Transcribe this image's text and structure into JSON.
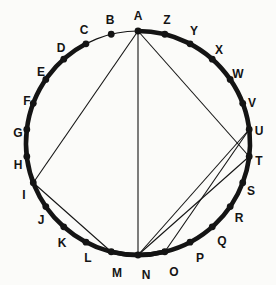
{
  "figure": {
    "type": "geometry-diagram",
    "background_color": "#fbfbf9",
    "stroke_color": "#141414",
    "circle": {
      "cx": 138,
      "cy": 143,
      "r": 112,
      "stroke_width": 1.2
    },
    "point_radius": 3.4,
    "labels": [
      {
        "id": "A",
        "text": "A",
        "angle": 90,
        "lx": 138,
        "ly": 16
      },
      {
        "id": "B",
        "text": "B",
        "angle": 103.846,
        "lx": 110,
        "ly": 20
      },
      {
        "id": "C",
        "text": "C",
        "angle": 117.692,
        "lx": 84,
        "ly": 30
      },
      {
        "id": "D",
        "text": "D",
        "angle": 131.538,
        "lx": 61,
        "ly": 48
      },
      {
        "id": "E",
        "text": "E",
        "angle": 145.385,
        "lx": 41,
        "ly": 72
      },
      {
        "id": "F",
        "text": "F",
        "angle": 159.231,
        "lx": 27,
        "ly": 101
      },
      {
        "id": "G",
        "text": "G",
        "angle": 173.077,
        "lx": 18,
        "ly": 133
      },
      {
        "id": "H",
        "text": "H",
        "angle": 186.923,
        "lx": 18,
        "ly": 165
      },
      {
        "id": "I",
        "text": "I",
        "angle": 200.769,
        "lx": 24,
        "ly": 195
      },
      {
        "id": "J",
        "text": "J",
        "angle": 214.615,
        "lx": 41,
        "ly": 220
      },
      {
        "id": "K",
        "text": "K",
        "angle": 228.462,
        "lx": 62,
        "ly": 243
      },
      {
        "id": "L",
        "text": "L",
        "angle": 242.308,
        "lx": 88,
        "ly": 258
      },
      {
        "id": "M",
        "text": "M",
        "angle": 256.154,
        "lx": 117,
        "ly": 273
      },
      {
        "id": "N",
        "text": "N",
        "angle": 270,
        "lx": 146,
        "ly": 275
      },
      {
        "id": "O",
        "text": "O",
        "angle": 283.846,
        "lx": 174,
        "ly": 272
      },
      {
        "id": "P",
        "text": "P",
        "angle": 297.692,
        "lx": 200,
        "ly": 258
      },
      {
        "id": "Q",
        "text": "Q",
        "angle": 311.538,
        "lx": 222,
        "ly": 241
      },
      {
        "id": "R",
        "text": "R",
        "angle": 325.385,
        "lx": 239,
        "ly": 218
      },
      {
        "id": "S",
        "text": "S",
        "angle": 339.231,
        "lx": 251,
        "ly": 191
      },
      {
        "id": "T",
        "text": "T",
        "angle": 353.077,
        "lx": 259,
        "ly": 161
      },
      {
        "id": "U",
        "text": "U",
        "angle": 6.923,
        "lx": 259,
        "ly": 131
      },
      {
        "id": "V",
        "text": "V",
        "angle": 20.769,
        "lx": 252,
        "ly": 103
      },
      {
        "id": "W",
        "text": "W",
        "angle": 34.615,
        "lx": 238,
        "ly": 74
      },
      {
        "id": "X",
        "text": "X",
        "angle": 48.462,
        "lx": 219,
        "ly": 50
      },
      {
        "id": "Y",
        "text": "Y",
        "angle": 62.308,
        "lx": 194,
        "ly": 31
      },
      {
        "id": "Z",
        "text": "Z",
        "angle": 76.154,
        "lx": 167,
        "ly": 20
      }
    ],
    "chords": [
      {
        "from": "A",
        "to": "I"
      },
      {
        "from": "A",
        "to": "N"
      },
      {
        "from": "A",
        "to": "T"
      },
      {
        "from": "I",
        "to": "M"
      },
      {
        "from": "N",
        "to": "U"
      },
      {
        "from": "N",
        "to": "T"
      },
      {
        "from": "O",
        "to": "U"
      },
      {
        "from": "U",
        "to": "T"
      }
    ],
    "highlighted_arcs": [
      {
        "from": "C",
        "to": "A",
        "stroke_width": 4.6
      },
      {
        "from": "M",
        "to": "O",
        "stroke_width": 4.6
      }
    ]
  }
}
